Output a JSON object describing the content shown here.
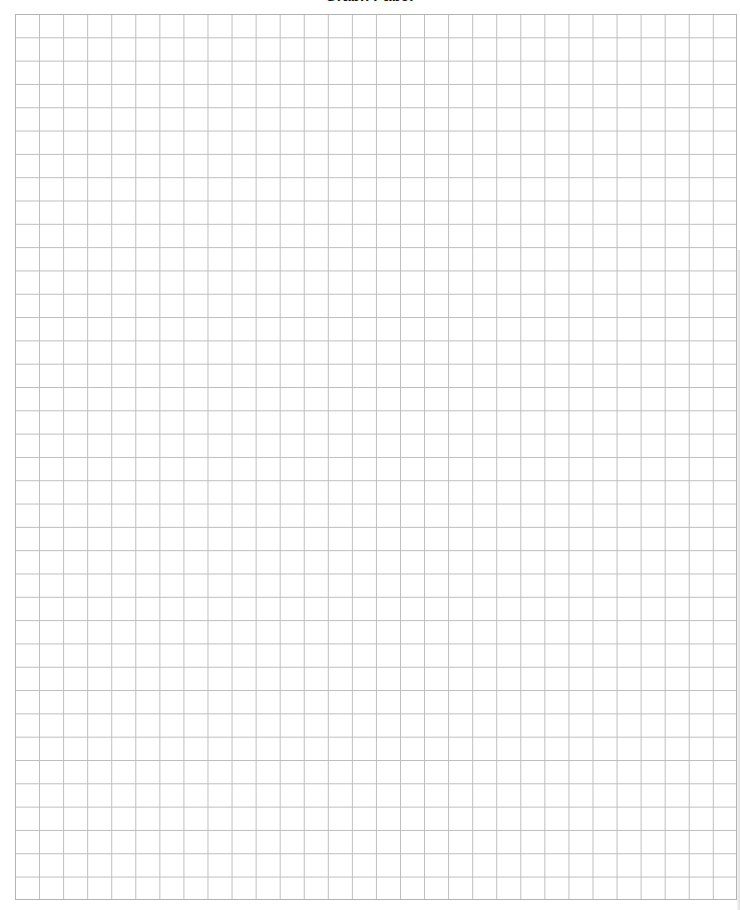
{
  "page": {
    "title": "Graph Paper",
    "background_color": "#ffffff",
    "line_color": "#bdbdbd"
  },
  "grid": {
    "columns": 30,
    "rows": 38,
    "left": 15,
    "top": 14,
    "right": 737,
    "bottom": 900
  }
}
